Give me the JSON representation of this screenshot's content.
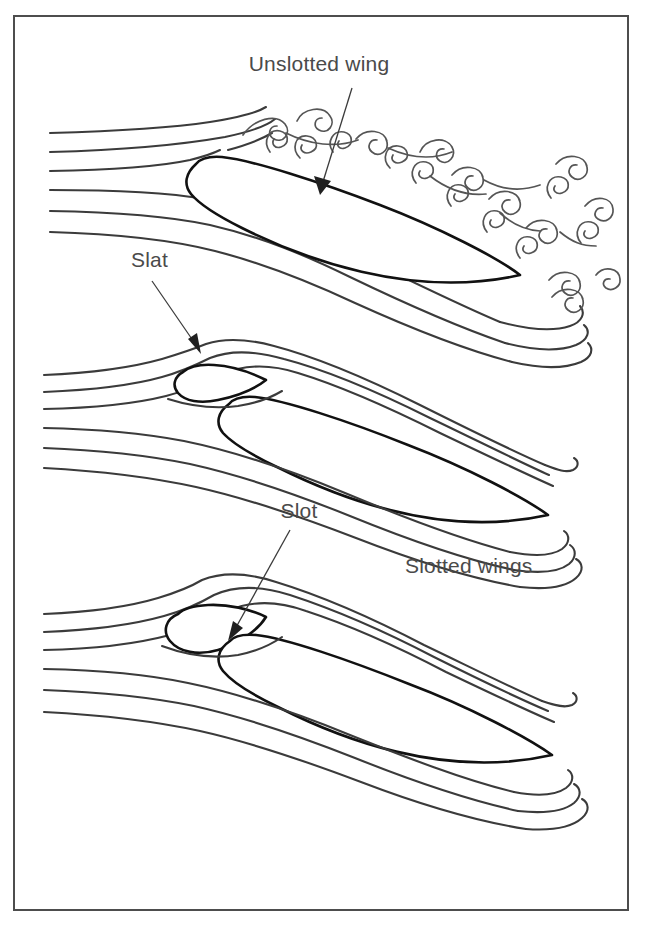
{
  "figure": {
    "frame": {
      "x": 14,
      "y": 16,
      "width": 614,
      "height": 894,
      "border_color": "#4d4d4d"
    },
    "colors": {
      "background": "#ffffff",
      "airfoil_outline": "#111111",
      "streamline": "#3b3b3b",
      "vortex": "#555555",
      "label_text": "#4a4a4a",
      "frame": "#4d4d4d"
    },
    "panels": [
      {
        "id": "panel-unslotted",
        "name": "unslotted-wing-panel",
        "label": "Unslotted wing",
        "description": "Airflow separating over a plain airfoil producing a turbulent wake of vortices",
        "streamline_count": 6,
        "has_slat": false,
        "flow_state": "separated"
      },
      {
        "id": "panel-slat",
        "name": "slotted-wing-slat-panel",
        "label": "Slat",
        "description": "Airfoil with a leading-edge slat; flow stays attached through the slot",
        "streamline_count": 6,
        "has_slat": true,
        "flow_state": "attached"
      },
      {
        "id": "panel-slot",
        "name": "slotted-wing-slot-panel",
        "label": "Slot",
        "description": "Airfoil with a leading-edge slat showing the slot gap; flow remains attached",
        "streamline_count": 6,
        "has_slat": true,
        "flow_state": "attached"
      }
    ],
    "labels": [
      {
        "id": "label-unslotted-wing",
        "text": "Unslotted wing",
        "x": 319,
        "y": 71,
        "anchor": "middle"
      },
      {
        "id": "label-slat",
        "text": "Slat",
        "x": 131,
        "y": 267,
        "anchor": "start"
      },
      {
        "id": "label-slot",
        "text": "Slot",
        "x": 299,
        "y": 518,
        "anchor": "middle"
      },
      {
        "id": "label-slotted-wings",
        "text": "Slotted wings",
        "x": 405,
        "y": 573,
        "anchor": "start"
      }
    ],
    "caption": ""
  }
}
